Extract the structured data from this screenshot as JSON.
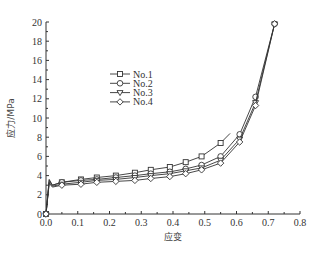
{
  "chart_data": {
    "type": "line",
    "title": "",
    "xlabel": "应变",
    "ylabel": "应力/MPa",
    "xlim": [
      0,
      0.8
    ],
    "ylim": [
      0,
      20
    ],
    "xticks": [
      "0.0",
      "0.1",
      "0.2",
      "0.3",
      "0.4",
      "0.5",
      "0.6",
      "0.7",
      "0.8"
    ],
    "yticks": [
      "0",
      "2",
      "4",
      "6",
      "8",
      "10",
      "12",
      "14",
      "16",
      "18",
      "20"
    ],
    "grid": false,
    "legend_position": "upper-left-inside",
    "series": [
      {
        "name": "No.1",
        "marker": "square",
        "x": [
          0,
          0.01,
          0.02,
          0.05,
          0.11,
          0.16,
          0.22,
          0.28,
          0.33,
          0.39,
          0.44,
          0.49,
          0.55,
          0.58
        ],
        "y": [
          0,
          3.6,
          3.0,
          3.3,
          3.6,
          3.8,
          4.0,
          4.3,
          4.6,
          4.9,
          5.4,
          6.0,
          7.4,
          8.4
        ]
      },
      {
        "name": "No.2",
        "marker": "circle",
        "x": [
          0,
          0.01,
          0.02,
          0.05,
          0.11,
          0.16,
          0.22,
          0.28,
          0.33,
          0.39,
          0.44,
          0.49,
          0.55,
          0.61,
          0.66,
          0.72
        ],
        "y": [
          0,
          3.5,
          3.0,
          3.3,
          3.5,
          3.6,
          3.8,
          4.0,
          4.2,
          4.4,
          4.7,
          5.1,
          6.0,
          8.3,
          12.2,
          19.8
        ]
      },
      {
        "name": "No.3",
        "marker": "triangle-down",
        "x": [
          0,
          0.01,
          0.02,
          0.05,
          0.11,
          0.16,
          0.22,
          0.28,
          0.33,
          0.39,
          0.44,
          0.49,
          0.55,
          0.61,
          0.66,
          0.72
        ],
        "y": [
          0,
          3.3,
          2.9,
          3.1,
          3.3,
          3.5,
          3.6,
          3.8,
          4.0,
          4.2,
          4.5,
          4.8,
          5.6,
          7.8,
          11.6,
          19.8
        ]
      },
      {
        "name": "No.4",
        "marker": "diamond",
        "x": [
          0,
          0.01,
          0.02,
          0.05,
          0.11,
          0.16,
          0.22,
          0.28,
          0.33,
          0.39,
          0.44,
          0.49,
          0.55,
          0.61,
          0.66,
          0.72
        ],
        "y": [
          0,
          3.2,
          2.8,
          3.0,
          3.1,
          3.3,
          3.4,
          3.5,
          3.7,
          3.9,
          4.2,
          4.6,
          5.3,
          7.5,
          11.3,
          19.8
        ]
      }
    ]
  }
}
